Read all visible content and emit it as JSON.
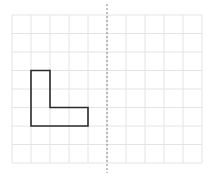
{
  "diagram": {
    "type": "reflection-grid",
    "grid": {
      "x0": 12,
      "y0": 15,
      "cols": 10,
      "rows": 8,
      "cell_w": 19.0,
      "cell_h": 18.5,
      "line_color": "#e4e4e4"
    },
    "mirror_line": {
      "x": 107,
      "y1": 4,
      "y2": 173,
      "color": "#9a9a9a",
      "style": "dashed"
    },
    "shape": {
      "name": "L-shape",
      "stroke": "#2b2b2b",
      "stroke_width": 1.6,
      "points_grid": [
        [
          1,
          3
        ],
        [
          2,
          3
        ],
        [
          2,
          5
        ],
        [
          4,
          5
        ],
        [
          4,
          6
        ],
        [
          1,
          6
        ]
      ]
    }
  }
}
